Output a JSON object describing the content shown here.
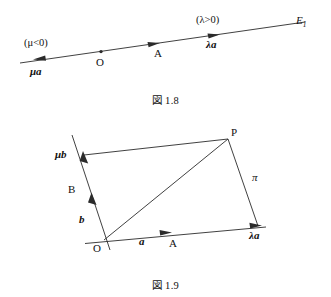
{
  "figures": [
    {
      "id": "fig-1-8",
      "caption": "図 1.8",
      "description": "Number line through O and A with scalar multiples of vector a",
      "labels": {
        "mu_condition": "(μ<0)",
        "mu_vector": "μa",
        "origin": "O",
        "point_a": "A",
        "lambda_condition": "(λ>0)",
        "lambda_vector": "λa",
        "line_name": "E",
        "line_name_sub": "1"
      },
      "geometry": {
        "line_start": [
          20,
          63
        ],
        "line_end": [
          305,
          22
        ],
        "origin_point": [
          101,
          52
        ],
        "point_a_dot": [
          157,
          44
        ],
        "left_arrow_tip": [
          36,
          60
        ],
        "right_arrow_a": [
          156,
          44
        ],
        "right_arrow_lambda": [
          216,
          35
        ]
      }
    },
    {
      "id": "fig-1-9",
      "caption": "図 1.9",
      "description": "Parallelogram OAPB showing P as lambda a plus mu b in plane pi",
      "labels": {
        "mu_b": "μb",
        "point_b": "B",
        "vector_b": "b",
        "origin": "O",
        "vector_a": "a",
        "point_a": "A",
        "lambda_a": "λa",
        "point_p": "P",
        "plane": "π"
      },
      "geometry": {
        "origin": [
          104,
          240
        ],
        "p_vertex": [
          228,
          139
        ],
        "lambda_a_vertex": [
          258,
          226
        ],
        "mu_b_vertex": [
          84,
          155
        ],
        "b_line_start": [
          72,
          135
        ],
        "b_line_end": [
          110,
          250
        ],
        "a_line_start": [
          85,
          243
        ],
        "a_line_end": [
          266,
          227
        ],
        "a_arrow_tip": [
          168,
          233
        ],
        "b_arrow_tip": [
          91,
          196
        ]
      }
    }
  ],
  "style": {
    "stroke": "#2b2b2b",
    "text_color": "#111111",
    "background": "#ffffff"
  }
}
